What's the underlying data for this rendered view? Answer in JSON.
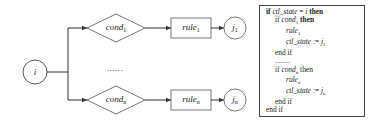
{
  "diagram": {
    "start_node": {
      "label": "i"
    },
    "branches": [
      {
        "condition": {
          "base": "cond",
          "sub": "1"
        },
        "rule": {
          "base": "rule",
          "sub": "1"
        },
        "target": {
          "base": "j",
          "sub": "1"
        }
      },
      {
        "condition": {
          "base": "cond",
          "sub": "n"
        },
        "rule": {
          "base": "rule",
          "sub": "n"
        },
        "target": {
          "base": "j",
          "sub": "n"
        }
      }
    ],
    "ellipsis": "......"
  },
  "code": {
    "lines": [
      {
        "kw1": "if",
        "var": "ctl_state",
        "op": " = ",
        "val": "i",
        "kw2": "then"
      },
      {
        "kw1": "if",
        "cond": "cond",
        "cond_sub": "1",
        "kw2": "then"
      },
      {
        "stmt": "rule",
        "stmt_sub": "1"
      },
      {
        "var": "ctl_state",
        "op": " := ",
        "val": "j",
        "val_sub": "1"
      },
      {
        "kw": "end if"
      },
      {
        "text": "........"
      },
      {
        "kw1": "if",
        "cond": "cond",
        "cond_sub": "n",
        "kw2": "then"
      },
      {
        "stmt": "rule",
        "stmt_sub": "n"
      },
      {
        "var": "ctl_state",
        "op": " := ",
        "val": "j",
        "val_sub": "n"
      },
      {
        "kw": "end if"
      },
      {
        "kw": "end if"
      }
    ]
  },
  "colors": {
    "stroke": "#444444",
    "text": "#222222",
    "background": "#ffffff"
  }
}
